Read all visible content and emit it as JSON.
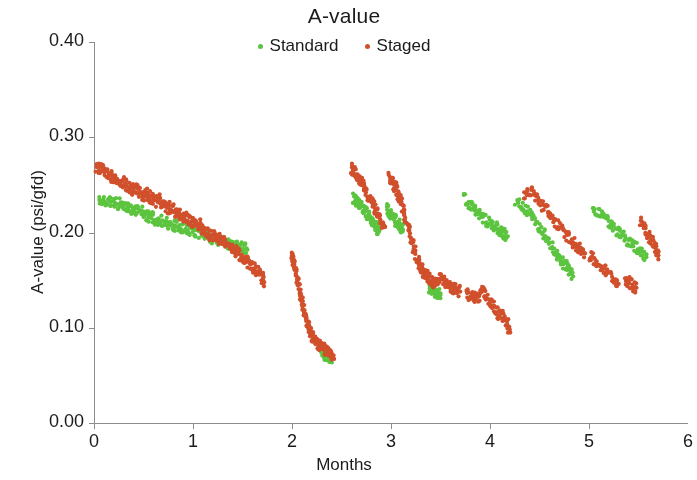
{
  "chart_data": {
    "type": "scatter",
    "title": "A-value",
    "xlabel": "Months",
    "ylabel": "A-value (psi/gfd)",
    "xlim": [
      0,
      6
    ],
    "ylim": [
      0.0,
      0.4
    ],
    "xticks": [
      0,
      1,
      2,
      3,
      4,
      5,
      6
    ],
    "xtick_labels": [
      "0",
      "1",
      "2",
      "3",
      "4",
      "5",
      "6"
    ],
    "yticks": [
      0.0,
      0.1,
      0.2,
      0.3,
      0.4
    ],
    "ytick_labels": [
      "0.00",
      "0.10",
      "0.20",
      "0.30",
      "0.40"
    ],
    "grid": false,
    "legend_position": "top-center",
    "marker_size": 2.1,
    "series": [
      {
        "name": "Standard",
        "color": "#5cc43f",
        "segments": [
          {
            "comment": "run 1 - 0.05 to 1.55 months",
            "x": [
              0.05,
              0.1,
              0.15,
              0.2,
              0.25,
              0.3,
              0.35,
              0.4,
              0.45,
              0.5,
              0.55,
              0.6,
              0.65,
              0.7,
              0.75,
              0.8,
              0.85,
              0.9,
              0.95,
              1.0,
              1.05,
              1.1,
              1.15,
              1.2,
              1.25,
              1.3,
              1.35,
              1.4,
              1.45,
              1.5,
              1.55
            ],
            "y": [
              0.234,
              0.233,
              0.231,
              0.233,
              0.23,
              0.229,
              0.226,
              0.222,
              0.225,
              0.221,
              0.217,
              0.215,
              0.213,
              0.212,
              0.21,
              0.208,
              0.207,
              0.205,
              0.203,
              0.202,
              0.2,
              0.198,
              0.196,
              0.194,
              0.192,
              0.19,
              0.189,
              0.187,
              0.186,
              0.184,
              0.182
            ]
          },
          {
            "comment": "run 2 tail - 2.30 to 2.40 months",
            "x": [
              2.3,
              2.32,
              2.34,
              2.36,
              2.38,
              2.4
            ],
            "y": [
              0.073,
              0.072,
              0.071,
              0.07,
              0.07,
              0.069
            ]
          },
          {
            "comment": "run 3 - 2.62 to 2.88 months",
            "x": [
              2.62,
              2.65,
              2.68,
              2.71,
              2.74,
              2.77,
              2.8,
              2.83,
              2.86,
              2.88
            ],
            "y": [
              0.237,
              0.234,
              0.231,
              0.228,
              0.223,
              0.218,
              0.213,
              0.208,
              0.204,
              0.201
            ]
          },
          {
            "comment": "run 4 - 2.96 to 3.12 months",
            "x": [
              2.96,
              2.99,
              3.02,
              3.05,
              3.08,
              3.1,
              3.12
            ],
            "y": [
              0.226,
              0.221,
              0.216,
              0.212,
              0.208,
              0.205,
              0.203
            ]
          },
          {
            "comment": "run 4 low tail - 3.38 to 3.50",
            "x": [
              3.38,
              3.41,
              3.44,
              3.47,
              3.5
            ],
            "y": [
              0.14,
              0.139,
              0.138,
              0.137,
              0.136
            ]
          },
          {
            "comment": "run 5 - 3.74 to 4.18 months",
            "x": [
              3.74,
              3.8,
              3.85,
              3.9,
              3.95,
              4.0,
              4.05,
              4.1,
              4.14,
              4.18
            ],
            "y": [
              0.238,
              0.228,
              0.223,
              0.219,
              0.214,
              0.21,
              0.206,
              0.202,
              0.199,
              0.196
            ]
          },
          {
            "comment": "run 6 - 4.26 to 4.84 months",
            "x": [
              4.26,
              4.32,
              4.38,
              4.44,
              4.5,
              4.56,
              4.62,
              4.68,
              4.72,
              4.76,
              4.8,
              4.84
            ],
            "y": [
              0.234,
              0.228,
              0.222,
              0.214,
              0.206,
              0.196,
              0.187,
              0.178,
              0.172,
              0.166,
              0.16,
              0.154
            ]
          },
          {
            "comment": "run 7 - 5.04 to 5.58 months",
            "x": [
              5.04,
              5.1,
              5.16,
              5.22,
              5.28,
              5.34,
              5.4,
              5.46,
              5.52,
              5.58
            ],
            "y": [
              0.226,
              0.221,
              0.215,
              0.209,
              0.203,
              0.197,
              0.191,
              0.185,
              0.18,
              0.174
            ]
          }
        ]
      },
      {
        "name": "Staged",
        "color": "#d1502c",
        "segments": [
          {
            "comment": "run 1 - 0.02 to 1.72 months",
            "x": [
              0.02,
              0.06,
              0.1,
              0.14,
              0.18,
              0.22,
              0.26,
              0.3,
              0.34,
              0.38,
              0.42,
              0.46,
              0.5,
              0.54,
              0.58,
              0.62,
              0.66,
              0.7,
              0.74,
              0.78,
              0.82,
              0.86,
              0.9,
              0.94,
              0.98,
              1.02,
              1.06,
              1.1,
              1.14,
              1.18,
              1.22,
              1.26,
              1.3,
              1.34,
              1.38,
              1.42,
              1.46,
              1.5,
              1.54,
              1.58,
              1.62,
              1.66,
              1.7,
              1.72
            ],
            "y": [
              0.266,
              0.267,
              0.264,
              0.261,
              0.258,
              0.255,
              0.252,
              0.253,
              0.249,
              0.245,
              0.247,
              0.242,
              0.238,
              0.241,
              0.236,
              0.232,
              0.234,
              0.229,
              0.225,
              0.227,
              0.222,
              0.218,
              0.214,
              0.216,
              0.211,
              0.207,
              0.209,
              0.204,
              0.2,
              0.196,
              0.198,
              0.193,
              0.189,
              0.191,
              0.186,
              0.182,
              0.178,
              0.174,
              0.17,
              0.166,
              0.162,
              0.158,
              0.152,
              0.148
            ]
          },
          {
            "comment": "run 2 - steep decline 2.00 to 2.42 months",
            "x": [
              2.0,
              2.01,
              2.02,
              2.04,
              2.06,
              2.08,
              2.1,
              2.12,
              2.14,
              2.16,
              2.18,
              2.2,
              2.22,
              2.24,
              2.26,
              2.28,
              2.3,
              2.33,
              2.36,
              2.39,
              2.42
            ],
            "y": [
              0.175,
              0.172,
              0.166,
              0.158,
              0.148,
              0.138,
              0.128,
              0.119,
              0.111,
              0.104,
              0.098,
              0.093,
              0.089,
              0.086,
              0.083,
              0.081,
              0.079,
              0.077,
              0.075,
              0.073,
              0.071
            ]
          },
          {
            "comment": "run 3 - 2.60 to 2.94 months",
            "x": [
              2.6,
              2.63,
              2.66,
              2.69,
              2.72,
              2.75,
              2.78,
              2.81,
              2.84,
              2.87,
              2.9,
              2.94
            ],
            "y": [
              0.268,
              0.264,
              0.259,
              0.254,
              0.248,
              0.242,
              0.236,
              0.23,
              0.224,
              0.218,
              0.212,
              0.206
            ]
          },
          {
            "comment": "run 4 - 2.98 to 3.70 months, peak then cliff",
            "x": [
              2.98,
              3.01,
              3.04,
              3.07,
              3.1,
              3.13,
              3.16,
              3.19,
              3.22,
              3.25,
              3.28,
              3.31,
              3.34,
              3.37,
              3.4,
              3.43,
              3.46,
              3.5,
              3.54,
              3.58,
              3.62,
              3.66,
              3.7
            ],
            "y": [
              0.258,
              0.254,
              0.248,
              0.242,
              0.234,
              0.222,
              0.21,
              0.198,
              0.186,
              0.176,
              0.168,
              0.162,
              0.157,
              0.153,
              0.15,
              0.148,
              0.146,
              0.152,
              0.147,
              0.144,
              0.142,
              0.14,
              0.138
            ]
          },
          {
            "comment": "run 5 - 3.76 to 4.20 months, lower band",
            "x": [
              3.76,
              3.8,
              3.84,
              3.88,
              3.92,
              3.96,
              4.0,
              4.04,
              4.08,
              4.12,
              4.16,
              4.2
            ],
            "y": [
              0.136,
              0.134,
              0.133,
              0.131,
              0.14,
              0.134,
              0.128,
              0.122,
              0.116,
              0.112,
              0.108,
              0.098
            ]
          },
          {
            "comment": "run 6 - 4.34 to 4.96 months",
            "x": [
              4.34,
              4.4,
              4.46,
              4.52,
              4.58,
              4.64,
              4.7,
              4.76,
              4.82,
              4.88,
              4.92,
              4.96
            ],
            "y": [
              0.238,
              0.244,
              0.238,
              0.23,
              0.222,
              0.214,
              0.206,
              0.198,
              0.192,
              0.186,
              0.182,
              0.178
            ]
          },
          {
            "comment": "run 6b - 5.00 to 5.30 months",
            "x": [
              5.0,
              5.06,
              5.12,
              5.18,
              5.24,
              5.3
            ],
            "y": [
              0.176,
              0.17,
              0.164,
              0.158,
              0.152,
              0.146
            ]
          },
          {
            "comment": "run 7 - 5.36 to 5.48 months",
            "x": [
              5.36,
              5.4,
              5.44,
              5.48
            ],
            "y": [
              0.152,
              0.148,
              0.144,
              0.142
            ]
          },
          {
            "comment": "run 8 - 5.52 to 5.70 months",
            "x": [
              5.52,
              5.56,
              5.6,
              5.64,
              5.68,
              5.7
            ],
            "y": [
              0.214,
              0.206,
              0.198,
              0.19,
              0.182,
              0.176
            ]
          }
        ]
      }
    ]
  },
  "plot": {
    "axis_color": "#8c8c8c",
    "background": "#ffffff",
    "margins": {
      "left": 94,
      "right": 688,
      "top": 42,
      "bottom": 423
    },
    "noise_amplitude": 0.006,
    "points_per_step": 9
  }
}
